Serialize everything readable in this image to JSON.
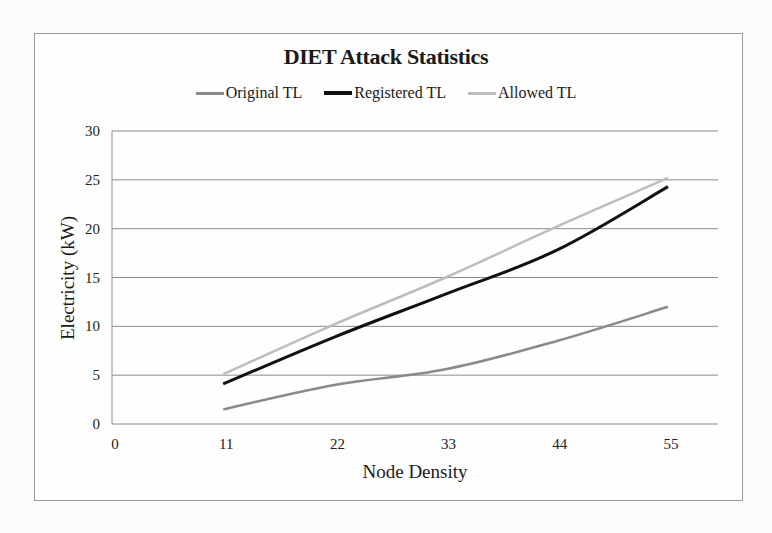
{
  "chart_data": {
    "type": "line",
    "title": "DIET Attack Statistics",
    "xlabel": "Node Density",
    "ylabel": "Electricity (kW)",
    "x": [
      11,
      22,
      33,
      44,
      55
    ],
    "x_ticks": [
      0,
      11,
      22,
      33,
      44,
      55
    ],
    "y_ticks": [
      0,
      5,
      10,
      15,
      20,
      25,
      30
    ],
    "xlim": [
      0,
      55
    ],
    "ylim": [
      0,
      30
    ],
    "grid": "horizontal",
    "legend_position": "top",
    "series": [
      {
        "name": "Original TL",
        "color": "#8a8a8a",
        "width": 2.5,
        "values": [
          1.5,
          4.0,
          5.6,
          8.5,
          12.0
        ]
      },
      {
        "name": "Registered TL",
        "color": "#111111",
        "width": 3,
        "values": [
          4.1,
          8.9,
          13.3,
          17.8,
          24.3
        ]
      },
      {
        "name": "Allowed TL",
        "color": "#bdbdbd",
        "width": 2.5,
        "values": [
          5.1,
          10.2,
          15.0,
          20.2,
          25.2
        ]
      }
    ]
  },
  "legend": {
    "items": [
      {
        "label": "Original TL",
        "color": "#8a8a8a"
      },
      {
        "label": "Registered TL",
        "color": "#111111"
      },
      {
        "label": "Allowed TL",
        "color": "#bdbdbd"
      }
    ]
  }
}
